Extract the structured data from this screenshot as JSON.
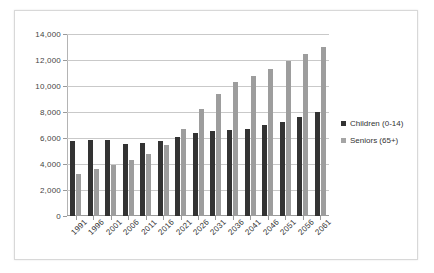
{
  "chart_data": {
    "type": "bar",
    "title": "",
    "subtitle": "",
    "xlabel": "",
    "ylabel": "",
    "ylim": [
      0,
      14000
    ],
    "ytick_step": 2000,
    "ytick_labels": [
      "14,000",
      "12,000",
      "10,000",
      "8,000",
      "6,000",
      "4,000",
      "2,000",
      "0"
    ],
    "ytick_values": [
      14000,
      12000,
      10000,
      8000,
      6000,
      4000,
      2000,
      0
    ],
    "grid": true,
    "legend_position": "right",
    "categories": [
      "1991",
      "1996",
      "2001",
      "2006",
      "2011",
      "2016",
      "2021",
      "2026",
      "2031",
      "2036",
      "2041",
      "2046",
      "2051",
      "2056",
      "2061"
    ],
    "series": [
      {
        "name": "Children (0-14)",
        "color": "#333333",
        "values": [
          5800,
          5850,
          5850,
          5550,
          5600,
          5800,
          6100,
          6400,
          6550,
          6600,
          6700,
          7000,
          7200,
          7600,
          8000
        ]
      },
      {
        "name": "Seniors (65+)",
        "color": "#9d9d9d",
        "values": [
          3200,
          3600,
          3900,
          4300,
          4800,
          5500,
          6700,
          8200,
          9400,
          10300,
          10800,
          11300,
          11900,
          12500,
          13000
        ]
      }
    ]
  },
  "legend": {
    "items": [
      {
        "label": "Children (0-14)"
      },
      {
        "label": "Seniors (65+)"
      }
    ]
  }
}
